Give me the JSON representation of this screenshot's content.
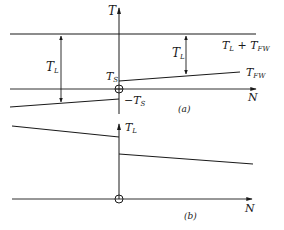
{
  "figure": {
    "panel_a": {
      "caption": "(a)",
      "y_axis_label": "T",
      "x_axis_label": "N",
      "top_line_label": {
        "main": "T",
        "sub1": "L",
        "plus": " + ",
        "main2": "T",
        "sub2": "FW"
      },
      "upper_line_label": {
        "main": "T",
        "sub": "FW"
      },
      "ts_label": {
        "main": "T",
        "sub": "S"
      },
      "neg_ts_label": {
        "prefix": "−",
        "main": "T",
        "sub": "S"
      },
      "left_dim_label": {
        "main": "T",
        "sub": "L"
      },
      "right_dim_label": {
        "main": "T",
        "sub": "L"
      }
    },
    "panel_b": {
      "caption": "(b)",
      "y_axis_label": {
        "main": "T",
        "sub": "L"
      },
      "x_axis_label": "N"
    },
    "colors": {
      "ink": "#1a1a1a",
      "background": "#ffffff"
    }
  }
}
